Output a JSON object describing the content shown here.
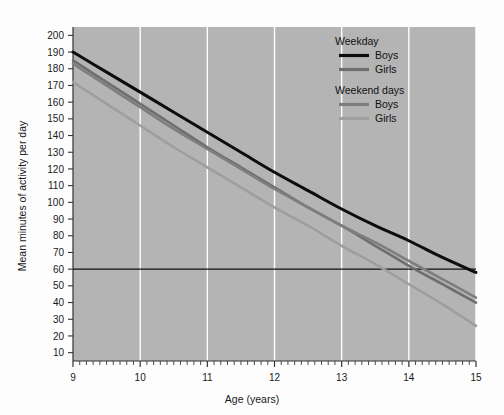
{
  "chart_data": {
    "type": "line",
    "title": "",
    "xlabel": "Age (years)",
    "ylabel": "Mean minutes of activity per day",
    "xlim": [
      9,
      15
    ],
    "ylim": [
      5,
      205
    ],
    "xticks": [
      9,
      10,
      11,
      12,
      13,
      14,
      15
    ],
    "xtick_labels": [
      "9",
      "10",
      "11",
      "12",
      "13",
      "14",
      "15"
    ],
    "yticks": [
      10,
      20,
      30,
      40,
      50,
      60,
      70,
      80,
      90,
      100,
      110,
      120,
      130,
      140,
      150,
      160,
      170,
      180,
      190,
      200
    ],
    "ytick_labels": [
      "10",
      "20",
      "30",
      "40",
      "50",
      "60",
      "70",
      "80",
      "90",
      "100",
      "110",
      "120",
      "130",
      "140",
      "150",
      "160",
      "170",
      "180",
      "190",
      "200"
    ],
    "grid": "vertical-white-gridlines-at-major-x-ticks",
    "plot_background": "#b4b4b4",
    "minor_xticks": true,
    "legend_position": "top-right-inside",
    "reference_line": {
      "axis": "y",
      "value": 60,
      "color": "#111111",
      "label": ""
    },
    "x": [
      9,
      9.5,
      10,
      10.5,
      11,
      11.5,
      12,
      12.5,
      13,
      13.5,
      14,
      14.5,
      15
    ],
    "series": [
      {
        "name": "Boys",
        "group": "Weekday",
        "color": "#0d0d0d",
        "width": 3.0,
        "values": [
          190,
          178,
          166,
          154,
          142,
          130,
          118,
          107,
          96,
          86,
          77,
          67,
          58
        ]
      },
      {
        "name": "Girls",
        "group": "Weekday",
        "color": "#6e6e6e",
        "width": 2.6,
        "values": [
          185,
          172,
          159,
          146,
          133,
          121,
          109,
          97,
          86,
          74,
          62,
          51,
          40
        ]
      },
      {
        "name": "Boys",
        "group": "Weekend days",
        "color": "#7e7e7e",
        "width": 2.6,
        "values": [
          183,
          170,
          157,
          144,
          132,
          120,
          108,
          97,
          86,
          76,
          65,
          54,
          43
        ]
      },
      {
        "name": "Girls",
        "group": "Weekend days",
        "color": "#9e9e9e",
        "width": 2.6,
        "values": [
          172,
          159,
          146,
          133,
          121,
          109,
          97,
          86,
          74,
          63,
          51,
          39,
          26
        ]
      }
    ]
  },
  "legend": {
    "groups": [
      {
        "heading": "Weekday",
        "entries": [
          {
            "label": "Boys",
            "color": "#0d0d0d"
          },
          {
            "label": "Girls",
            "color": "#6e6e6e"
          }
        ]
      },
      {
        "heading": "Weekend days",
        "entries": [
          {
            "label": "Boys",
            "color": "#7e7e7e"
          },
          {
            "label": "Girls",
            "color": "#9e9e9e"
          }
        ]
      }
    ]
  }
}
